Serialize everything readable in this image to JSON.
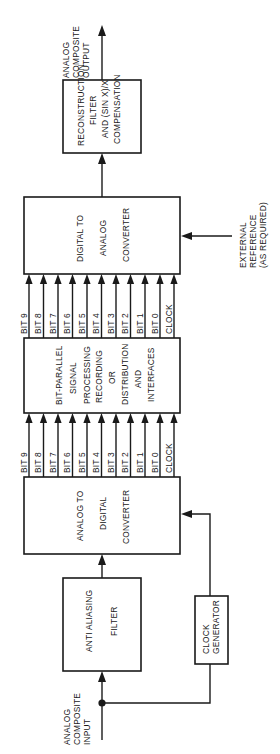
{
  "diagram": {
    "orientation": "rotated-90-ccw",
    "input": {
      "lines": [
        "ANALOG",
        "COMPOSITE",
        "INPUT"
      ]
    },
    "output": {
      "lines": [
        "ANALOG",
        "COMPOSITE",
        "OUTPUT"
      ]
    },
    "external_reference": {
      "lines": [
        "EXTERNAL",
        "REFERENCE",
        "(AS REQUIRED)"
      ]
    },
    "blocks": {
      "anti_aliasing_filter": {
        "lines": [
          "ANTI  ALIASING",
          "FILTER"
        ]
      },
      "clock_generator": {
        "lines": [
          "CLOCK",
          "GENERATOR"
        ]
      },
      "adc": {
        "lines": [
          "ANALOG TO",
          "DIGITAL",
          "CONVERTER"
        ]
      },
      "processing": {
        "lines": [
          "BIT-PARALLEL",
          "SIGNAL",
          "PROCESSING",
          "RECORDING",
          "OR",
          "DISTRIBUTION",
          "AND",
          "INTERFACES"
        ]
      },
      "dac": {
        "lines": [
          "DIGITAL TO",
          "ANALOG",
          "CONVERTER"
        ]
      },
      "reconstruction_filter": {
        "lines": [
          "RECONSTRUCTION",
          "FILTER",
          "AND (SIN X)/X",
          "COMPENSATION"
        ]
      }
    },
    "bus_signals": [
      "BIT 9",
      "BIT 8",
      "BIT 7",
      "BIT 6",
      "BIT 5",
      "BIT 4",
      "BIT 3",
      "BIT 2",
      "BIT 1",
      "BIT 0",
      "CLOCK"
    ],
    "colors": {
      "ink": "#1a1a1a",
      "background": "#ffffff"
    }
  }
}
